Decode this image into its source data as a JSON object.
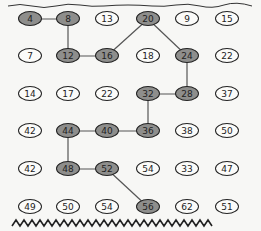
{
  "puzzle": {
    "columns": [
      30,
      68,
      107,
      148,
      187,
      227
    ],
    "rows": [
      19,
      56,
      94,
      131,
      169,
      207
    ],
    "grid": [
      [
        4,
        8,
        13,
        20,
        9,
        15
      ],
      [
        7,
        12,
        16,
        18,
        24,
        22
      ],
      [
        14,
        17,
        22,
        32,
        28,
        37
      ],
      [
        42,
        44,
        40,
        36,
        38,
        50
      ],
      [
        42,
        48,
        52,
        54,
        33,
        47
      ],
      [
        49,
        50,
        54,
        56,
        62,
        51
      ]
    ],
    "path": [
      [
        0,
        0
      ],
      [
        0,
        1
      ],
      [
        1,
        1
      ],
      [
        1,
        2
      ],
      [
        0,
        3
      ],
      [
        1,
        4
      ],
      [
        2,
        4
      ],
      [
        2,
        3
      ],
      [
        3,
        3
      ],
      [
        3,
        2
      ],
      [
        3,
        1
      ],
      [
        4,
        1
      ],
      [
        4,
        2
      ],
      [
        5,
        3
      ]
    ],
    "path_values": [
      4,
      8,
      12,
      16,
      20,
      24,
      28,
      32,
      36,
      40,
      44,
      48,
      52,
      56
    ],
    "colors": {
      "shaded": "#8e8e8c",
      "line": "#555555",
      "outline": "#222222"
    }
  }
}
